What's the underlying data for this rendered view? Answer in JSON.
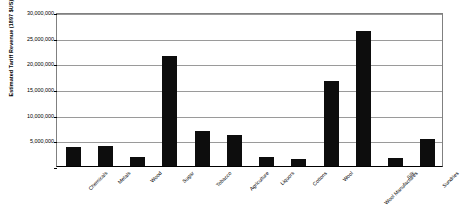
{
  "chart_data": {
    "type": "bar",
    "title": "",
    "xlabel": "",
    "ylabel": "Estimated Tariff Revenue (1897 $US)",
    "ylim": [
      0,
      30000000
    ],
    "ytick_values": [
      0,
      5000000,
      10000000,
      15000000,
      20000000,
      25000000,
      30000000
    ],
    "ytick_labels": [
      "",
      "5,000,000",
      "10,000,000",
      "15,000,000",
      "20,000,000",
      "25,000,000",
      "30,000,000"
    ],
    "grid": true,
    "legend": false,
    "bar_color": "#0d0d0d",
    "categories": [
      "Chemicals",
      "Metals",
      "Wood",
      "Sugar",
      "Tobacco",
      "Agriculture",
      "Liquors",
      "Cottons",
      "Wool",
      "Wool Manufactures",
      "Silk",
      "Sundries"
    ],
    "values": [
      3700000,
      3900000,
      1700000,
      21400000,
      6900000,
      6000000,
      1800000,
      1400000,
      16600000,
      26300000,
      1500000,
      5300000
    ]
  }
}
